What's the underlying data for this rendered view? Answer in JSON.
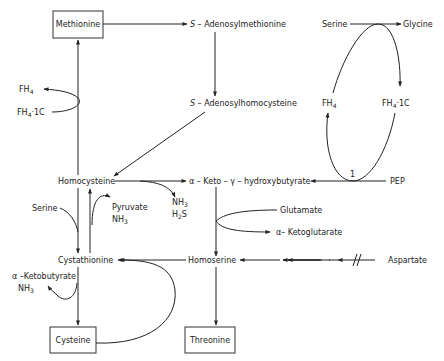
{
  "diagram": {
    "title": "",
    "boxed_nodes": {
      "methionine": "Methionine",
      "cysteine": "Cysteine",
      "threonine": "Threonine"
    },
    "nodes": {
      "s_adenosylmethionine_prefix": "S",
      "s_adenosylmethionine": " – Adenosylmethionine",
      "s_adenosylhomocysteine_prefix": "S",
      "s_adenosylhomocysteine": " – Adenosylhomocysteine",
      "homocysteine": "Homocysteine",
      "keto_hydroxybutyrate": "α – Keto – γ – hydroxybutyrate",
      "cystathionine": "Cystathionine",
      "homoserine": "Homoserine",
      "aspartate": "Aspartate",
      "pep": "PEP",
      "serine_top": "Serine",
      "glycine": "Glycine",
      "fh4_right": "FH",
      "fh4_1c_right": "FH",
      "fh4_left": "FH",
      "fh4_1c_left": "FH",
      "serine_left": "Serine",
      "pyruvate": "Pyruvate",
      "nh3_pyruvate": "NH",
      "nh3_h2s_a": "NH",
      "h2s": "H",
      "glutamate": "Glutamate",
      "ketoglutarate": "α– Ketoglutarate",
      "ketobutyrate": "α –Ketobutyrate",
      "nh3_ketobutyrate": "NH"
    },
    "subscripts": {
      "four": "4",
      "three": "3",
      "two": "2",
      "one_c": "·1C",
      "h2s_tail": "S"
    },
    "annotations": {
      "enzyme_number": "1",
      "feedback_inhibition_mark": "//"
    }
  }
}
